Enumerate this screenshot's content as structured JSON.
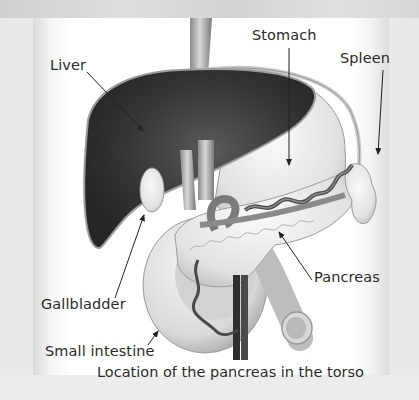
{
  "figure": {
    "caption": "Location of the pancreas in the torso",
    "colors": {
      "background": "#e9e9e9",
      "panel": "#ffffff",
      "liver": "#3a3a3a",
      "organ_light": "#e4e4e4",
      "vessel_dark": "#4a4a4a",
      "text": "#2b2b2b"
    }
  },
  "labels": [
    {
      "id": "liver",
      "text": "Liver"
    },
    {
      "id": "stomach",
      "text": "Stomach"
    },
    {
      "id": "spleen",
      "text": "Spleen"
    },
    {
      "id": "pancreas",
      "text": "Pancreas"
    },
    {
      "id": "gallbladder",
      "text": "Gallbladder"
    },
    {
      "id": "small_intestine",
      "text": "Small intestine"
    }
  ]
}
